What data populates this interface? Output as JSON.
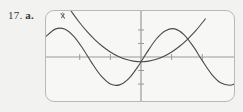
{
  "exercise": {
    "number": "17.",
    "part": "a."
  },
  "colors": {
    "page_background": "#f2f2f0",
    "screen_background": "#f7f7f5",
    "screen_border": "#b9b9b7",
    "axis": "#9a9a98",
    "curve": "#4a4a48",
    "label_text": "#3a3a3a",
    "cursor_mark": "#6b6b69"
  },
  "screen": {
    "frame_name": "graphing-calculator-screen",
    "corner_radius": 9
  },
  "annotations": [
    {
      "name": "pencil-cursor-mark",
      "x": 64,
      "y": 18,
      "description": "small hand-drawn pencil tick near upper-left of screen"
    }
  ],
  "chart_data": {
    "type": "line",
    "title": "",
    "subtitle": "",
    "xlabel": "",
    "ylabel": "",
    "xlim": [
      -6.2,
      6.2
    ],
    "ylim": [
      -3.4,
      3.4
    ],
    "grid": false,
    "legend": "none",
    "axes": {
      "x_axis_pixel_y": 61,
      "y_axis_pixel_x": 122,
      "x_tick_values": [
        -4,
        -2,
        2,
        4
      ],
      "y_tick_values": [
        -2,
        -1,
        1,
        2
      ],
      "tick_length_px": 3
    },
    "series": [
      {
        "name": "parabola",
        "equation": "y = 0.18x^2 - 0.35",
        "style": "solid",
        "points_x": [
          -6.2,
          -5.5,
          -5,
          -4.5,
          -4,
          -3.5,
          -3,
          -2.5,
          -2,
          -1.5,
          -1,
          -0.5,
          0,
          0.5,
          1,
          1.5,
          2,
          2.5,
          3,
          3.5,
          4,
          4.2
        ],
        "points_y": [
          6.57,
          5.1,
          4.15,
          3.3,
          2.53,
          1.85,
          1.27,
          0.775,
          0.37,
          0.055,
          -0.17,
          -0.305,
          -0.35,
          -0.305,
          -0.17,
          0.055,
          0.37,
          0.775,
          1.27,
          1.85,
          2.53,
          2.82
        ]
      },
      {
        "name": "sine-wave",
        "equation": "y = 2.1 sin(1.15x + 0.15)",
        "style": "solid",
        "points_x": [
          -6.2,
          -5.6,
          -5,
          -4.4,
          -3.8,
          -3.2,
          -2.6,
          -2,
          -1.4,
          -0.8,
          -0.2,
          0.4,
          1,
          1.6,
          2.2,
          2.8,
          3.4,
          4,
          4.6,
          5.2,
          5.8,
          6.2
        ],
        "points_y": [
          1.52,
          2.06,
          2.07,
          1.55,
          0.63,
          -0.45,
          -1.4,
          -1.99,
          -2.06,
          -1.6,
          -0.71,
          0.36,
          1.33,
          1.94,
          2.08,
          1.66,
          0.8,
          -0.27,
          -1.26,
          -1.91,
          -2.09,
          -1.93
        ]
      }
    ]
  }
}
